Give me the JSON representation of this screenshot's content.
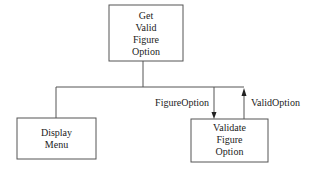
{
  "diagram": {
    "type": "structure-chart",
    "colors": {
      "line": "#555555",
      "text": "#222222",
      "background": "#ffffff"
    },
    "nodes": {
      "root": {
        "lines": [
          "Get",
          "Valid",
          "Figure",
          "Option"
        ]
      },
      "display": {
        "lines": [
          "Display",
          "Menu"
        ]
      },
      "validate": {
        "lines": [
          "Validate",
          "Figure",
          "Option"
        ]
      }
    },
    "edges": [
      {
        "from": "root",
        "to": "display"
      },
      {
        "from": "root",
        "to": "validate"
      }
    ],
    "couples": {
      "down": {
        "label": "FigureOption",
        "direction": "down",
        "to": "validate"
      },
      "up": {
        "label": "ValidOption",
        "direction": "up",
        "from": "validate"
      }
    }
  }
}
